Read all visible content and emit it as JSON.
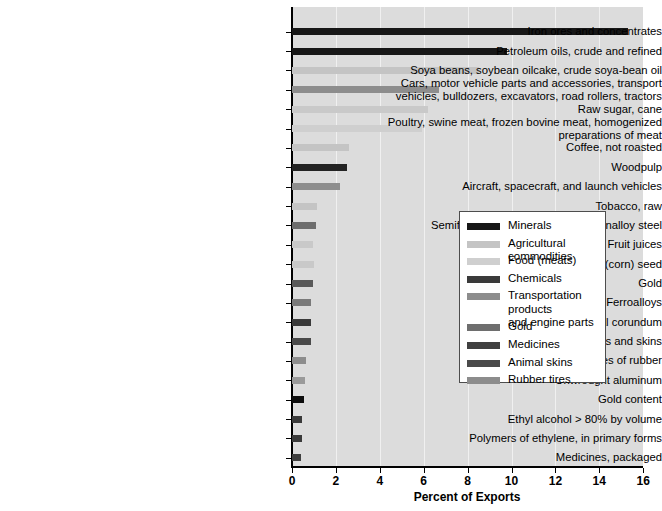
{
  "chart_data": {
    "type": "bar",
    "orientation": "horizontal",
    "title": "",
    "xlabel": "Percent of Exports",
    "ylabel": "",
    "xlim": [
      0,
      16
    ],
    "xticks": [
      0,
      2,
      4,
      6,
      8,
      10,
      12,
      14,
      16
    ],
    "xticklabels": [
      "0",
      "2",
      "4",
      "6",
      "8",
      "10",
      "12",
      "14",
      "16"
    ],
    "grid": "vertical",
    "legend_position": "center-right",
    "categories": [
      "Iron ores and concentrates",
      "Petroleum oils, crude and refined",
      "Soya beans, soybean oilcake, crude soya-bean oil",
      "Cars, motor vehicle parts and accessories, transport\nvehicles, bulldozers, excavators, road rollers, tractors",
      "Raw sugar, cane",
      "Poultry, swine meat, frozen bovine meat, homogenized\npreparations of meat",
      "Coffee, not roasted",
      "Woodpulp",
      "Aircraft, spacecraft, and launch vehicles",
      "Tobacco, raw",
      "Semifinished products of iron or nonalloy steel",
      "Fruit juices",
      "Maize (corn) seed",
      "Gold",
      "Ferroalloys",
      "Artificial corundum",
      "Tanned hides and skins",
      "New pneumatic tires of rubber",
      "Unwrought aluminum",
      "Gold content",
      "Ethyl alcohol > 80% by volume",
      "Polymers of ethylene, in primary forms",
      "Medicines, packaged"
    ],
    "values": [
      15.3,
      9.8,
      8.5,
      6.7,
      6.2,
      5.9,
      2.6,
      2.5,
      2.2,
      1.15,
      1.1,
      0.97,
      1.0,
      0.96,
      0.88,
      0.88,
      0.88,
      0.62,
      0.58,
      0.55,
      0.47,
      0.47,
      0.4
    ],
    "group_of_category": [
      "Minerals",
      "Minerals",
      "Agricultural commodities",
      "Transportation products and engine parts",
      "Agricultural commodities",
      "Food (meats)",
      "Agricultural commodities",
      "Chemicals",
      "Transportation products and engine parts",
      "Agricultural commodities",
      "Minerals",
      "Agricultural commodities",
      "Agricultural commodities",
      "Gold",
      "Minerals",
      "Chemicals",
      "Animal skins",
      "Rubber tires",
      "Minerals",
      "Gold",
      "Chemicals",
      "Chemicals",
      "Medicines"
    ],
    "bar_colors": [
      "#171717",
      "#171717",
      "#c4c4c4",
      "#8d8d8d",
      "#c9c9c9",
      "#cfcfcf",
      "#c4c4c4",
      "#232323",
      "#8d8d8d",
      "#c4c4c4",
      "#6d6d6d",
      "#c9c9c9",
      "#c9c9c9",
      "#595959",
      "#7a7a7a",
      "#3a3a3a",
      "#4a4a4a",
      "#8d8d8d",
      "#9a9a9a",
      "#0d0d0d",
      "#3a3a3a",
      "#3a3a3a",
      "#3f3f3f"
    ]
  },
  "legend": {
    "entries": [
      {
        "label": "Minerals",
        "color": "#171717"
      },
      {
        "label": "Agricultural commodities",
        "color": "#c4c4c4"
      },
      {
        "label": "Food (meats)",
        "color": "#cfcfcf"
      },
      {
        "label": "Chemicals",
        "color": "#3a3a3a"
      },
      {
        "label": "Transportation products\nand engine parts",
        "color": "#8d8d8d"
      },
      {
        "label": "Gold",
        "color": "#6e6e6e"
      },
      {
        "label": "Medicines",
        "color": "#404040"
      },
      {
        "label": "Animal skins",
        "color": "#4a4a4a"
      },
      {
        "label": "Rubber tires",
        "color": "#8c8c8c"
      }
    ]
  },
  "colors": {
    "plot_background": "#dcdcdc",
    "gridline": "#f0f0f0",
    "axis": "#000000",
    "legend_border": "#4d4d4d",
    "legend_background": "#ffffff"
  }
}
